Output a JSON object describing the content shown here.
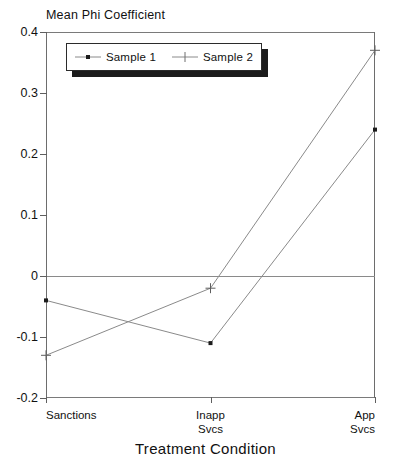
{
  "chart_data": {
    "type": "line",
    "title": "",
    "ylabel": "Mean Phi Coefficient",
    "xlabel": "Treatment Condition",
    "categories": [
      "Sanctions",
      "Inapp Svcs",
      "App Svcs"
    ],
    "category_lines": [
      [
        "Sanctions"
      ],
      [
        "Inapp",
        "Svcs"
      ],
      [
        "App",
        "Svcs"
      ]
    ],
    "ylim": [
      -0.2,
      0.4
    ],
    "yticks": [
      0.4,
      0.3,
      0.2,
      0.1,
      0,
      -0.1,
      -0.2
    ],
    "ytick_labels": [
      "0.4",
      "0.3",
      "0.2",
      "0.1",
      "0",
      "-0.1",
      "-0.2"
    ],
    "grid": false,
    "zero_line": true,
    "legend_position": "top-left-inside",
    "series": [
      {
        "name": "Sample 1",
        "marker": "square-dot",
        "values": [
          -0.04,
          -0.11,
          0.24
        ]
      },
      {
        "name": "Sample 2",
        "marker": "plus",
        "values": [
          -0.13,
          -0.02,
          0.37
        ]
      }
    ]
  },
  "legend": {
    "entries": [
      {
        "label": "Sample 1"
      },
      {
        "label": "Sample 2"
      }
    ]
  },
  "colors": {
    "line": "#8a8a8a",
    "marker": "#1c1c1c",
    "axis": "#6d6d6d",
    "text": "#111111",
    "legend_shadow": "#1c1c1c",
    "background": "#ffffff"
  }
}
